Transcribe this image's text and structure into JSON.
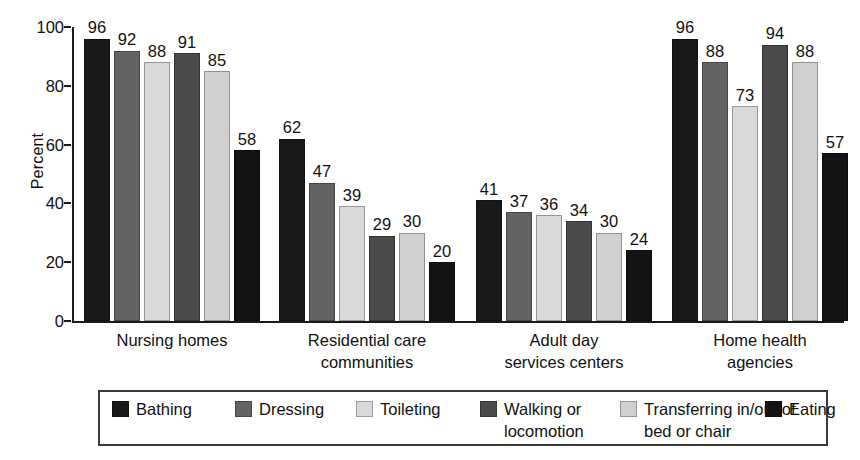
{
  "chart_data": {
    "type": "bar",
    "title": "",
    "xlabel": "",
    "ylabel": "Percent",
    "ylim": [
      0,
      100
    ],
    "yticks": [
      0,
      20,
      40,
      60,
      80,
      100
    ],
    "grid": false,
    "legend_position": "bottom",
    "categories": [
      "Nursing  homes",
      "Residential care\ncommunities",
      "Adult day\nservices centers",
      "Home health\nagencies"
    ],
    "series": [
      {
        "name": "Bathing",
        "color": "#191919",
        "values": [
          96,
          62,
          41,
          96
        ]
      },
      {
        "name": "Dressing",
        "color": "#636363",
        "values": [
          92,
          47,
          37,
          88
        ]
      },
      {
        "name": "Toileting",
        "color": "#d9d9d9",
        "values": [
          88,
          39,
          36,
          73
        ]
      },
      {
        "name": "Walking or\nlocomotion",
        "color": "#4a4a4a",
        "values": [
          91,
          29,
          34,
          94
        ]
      },
      {
        "name": "Transferring in/out of\nbed or chair",
        "color": "#cfcfcf",
        "values": [
          85,
          30,
          30,
          88
        ]
      },
      {
        "name": "Eating",
        "color": "#141414",
        "values": [
          58,
          20,
          24,
          57
        ]
      }
    ]
  },
  "legend": {
    "items": [
      {
        "label": "Bathing"
      },
      {
        "label": "Dressing"
      },
      {
        "label": "Toileting"
      },
      {
        "label": "Walking or\nlocomotion"
      },
      {
        "label": "Transferring in/out of\nbed or chair"
      },
      {
        "label": "Eating"
      }
    ]
  }
}
